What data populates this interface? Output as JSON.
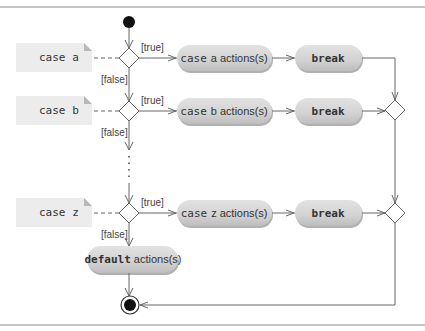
{
  "diagram": {
    "type": "UML activity diagram",
    "colors": {
      "frame_line": "#8a8a8a",
      "note_fill": "#ececec",
      "note_fold": "#b8b8b8",
      "action_fill": "#d6d6d6",
      "action_shadow": "#b0b0b0",
      "edge": "#666666",
      "node": "#111111",
      "text": "#333333"
    },
    "initial_node": {
      "label": ""
    },
    "cases": [
      {
        "note": {
          "keyword": "case",
          "value": "a"
        },
        "guard_true": "[true]",
        "guard_false": "[false]",
        "action": {
          "keyword": "case",
          "value": "a",
          "suffix": "actions(s)"
        },
        "break_label": "break"
      },
      {
        "note": {
          "keyword": "case",
          "value": "b"
        },
        "guard_true": "[true]",
        "guard_false": "[false]",
        "action": {
          "keyword": "case",
          "value": "b",
          "suffix": "actions(s)"
        },
        "break_label": "break"
      },
      {
        "note": {
          "keyword": "case",
          "value": "z"
        },
        "guard_true": "[true]",
        "guard_false": "[false]",
        "action": {
          "keyword": "case",
          "value": "z",
          "suffix": "actions(s)"
        },
        "break_label": "break"
      }
    ],
    "default_action": {
      "keyword": "default",
      "suffix": "actions(s)"
    },
    "ellipsis": "⋮",
    "final_node": {
      "label": ""
    }
  }
}
